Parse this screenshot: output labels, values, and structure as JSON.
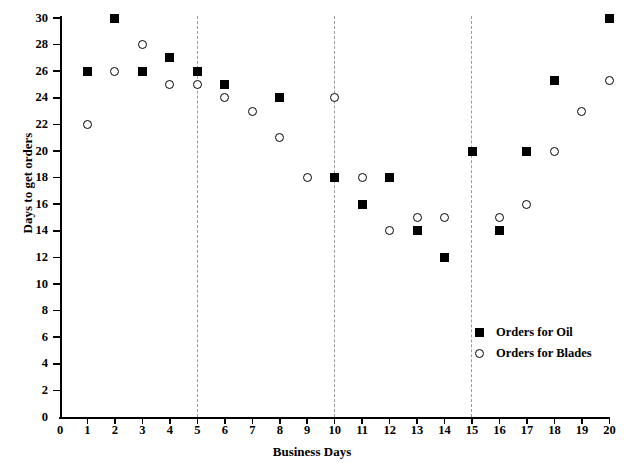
{
  "chart_data": {
    "type": "scatter",
    "title": "",
    "xlabel": "Business Days",
    "ylabel": "Days to get orders",
    "xlim": [
      0,
      20
    ],
    "ylim": [
      0,
      30
    ],
    "xticks": [
      0,
      1,
      2,
      3,
      4,
      5,
      6,
      7,
      8,
      9,
      10,
      11,
      12,
      13,
      14,
      15,
      16,
      17,
      18,
      19,
      20
    ],
    "yticks": [
      0,
      2,
      4,
      6,
      8,
      10,
      12,
      14,
      16,
      18,
      20,
      22,
      24,
      26,
      28,
      30
    ],
    "grid": false,
    "legend_position": "lower-right",
    "reference_lines": {
      "orientation": "vertical",
      "style": "dashed",
      "color": "#9a9a9a",
      "x_values": [
        5,
        10,
        15
      ]
    },
    "series": [
      {
        "name": "Orders for Oil",
        "marker": "filled-square",
        "color": "#000000",
        "points": [
          {
            "x": 1,
            "y": 26
          },
          {
            "x": 2,
            "y": 30
          },
          {
            "x": 3,
            "y": 26
          },
          {
            "x": 4,
            "y": 27
          },
          {
            "x": 5,
            "y": 26
          },
          {
            "x": 6,
            "y": 25
          },
          {
            "x": 8,
            "y": 24
          },
          {
            "x": 10,
            "y": 18
          },
          {
            "x": 11,
            "y": 16
          },
          {
            "x": 12,
            "y": 18
          },
          {
            "x": 13,
            "y": 14
          },
          {
            "x": 14,
            "y": 12
          },
          {
            "x": 15,
            "y": 20
          },
          {
            "x": 16,
            "y": 14
          },
          {
            "x": 17,
            "y": 20
          },
          {
            "x": 18,
            "y": 25.3
          },
          {
            "x": 20,
            "y": 30
          }
        ]
      },
      {
        "name": "Orders for Blades",
        "marker": "open-circle",
        "color": "#000000",
        "points": [
          {
            "x": 1,
            "y": 22
          },
          {
            "x": 2,
            "y": 26
          },
          {
            "x": 3,
            "y": 28
          },
          {
            "x": 4,
            "y": 25
          },
          {
            "x": 5,
            "y": 25
          },
          {
            "x": 6,
            "y": 24
          },
          {
            "x": 7,
            "y": 23
          },
          {
            "x": 8,
            "y": 21
          },
          {
            "x": 9,
            "y": 18
          },
          {
            "x": 10,
            "y": 24
          },
          {
            "x": 11,
            "y": 18
          },
          {
            "x": 12,
            "y": 14
          },
          {
            "x": 13,
            "y": 15
          },
          {
            "x": 14,
            "y": 15
          },
          {
            "x": 16,
            "y": 15
          },
          {
            "x": 17,
            "y": 16
          },
          {
            "x": 18,
            "y": 20
          },
          {
            "x": 19,
            "y": 23
          },
          {
            "x": 20,
            "y": 25.3
          }
        ]
      }
    ]
  },
  "legend": {
    "items": [
      {
        "label": "Orders for Oil",
        "marker": "filled-square"
      },
      {
        "label": "Orders for Blades",
        "marker": "open-circle"
      }
    ]
  },
  "axes": {
    "x_title": "Business Days",
    "y_title": "Days to get orders"
  }
}
